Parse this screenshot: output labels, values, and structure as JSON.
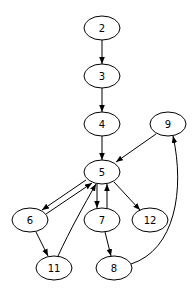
{
  "graph": {
    "type": "directed",
    "nodes": [
      {
        "id": "2",
        "label": "2",
        "cx": 102,
        "cy": 28
      },
      {
        "id": "3",
        "label": "3",
        "cx": 102,
        "cy": 76
      },
      {
        "id": "4",
        "label": "4",
        "cx": 102,
        "cy": 124
      },
      {
        "id": "9",
        "label": "9",
        "cx": 168,
        "cy": 124
      },
      {
        "id": "5",
        "label": "5",
        "cx": 102,
        "cy": 172
      },
      {
        "id": "6",
        "label": "6",
        "cx": 30,
        "cy": 220
      },
      {
        "id": "7",
        "label": "7",
        "cx": 102,
        "cy": 220
      },
      {
        "id": "12",
        "label": "12",
        "cx": 150,
        "cy": 220
      },
      {
        "id": "11",
        "label": "11",
        "cx": 54,
        "cy": 268
      },
      {
        "id": "8",
        "label": "8",
        "cx": 114,
        "cy": 268
      }
    ],
    "edges": [
      {
        "from": "2",
        "to": "3"
      },
      {
        "from": "3",
        "to": "4"
      },
      {
        "from": "4",
        "to": "5"
      },
      {
        "from": "9",
        "to": "5"
      },
      {
        "from": "5",
        "to": "6"
      },
      {
        "from": "6",
        "to": "5"
      },
      {
        "from": "5",
        "to": "7"
      },
      {
        "from": "7",
        "to": "5"
      },
      {
        "from": "5",
        "to": "12"
      },
      {
        "from": "6",
        "to": "11"
      },
      {
        "from": "11",
        "to": "5"
      },
      {
        "from": "7",
        "to": "8"
      },
      {
        "from": "8",
        "to": "9"
      }
    ]
  }
}
